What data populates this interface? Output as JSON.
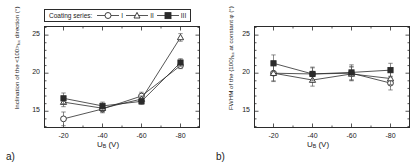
{
  "figure": {
    "panel_a_label": "a)",
    "panel_b_label": "b)"
  },
  "legend": {
    "title": "Coating series:",
    "entries": [
      {
        "label": "I",
        "marker": "open-circle"
      },
      {
        "label": "II",
        "marker": "open-triangle"
      },
      {
        "label": "III",
        "marker": "filled-square"
      }
    ]
  },
  "chart_data": [
    {
      "type": "line",
      "panel": "a",
      "title": "",
      "xlabel": "U_B (V)",
      "ylabel": "Inclination of the <100>fcc direction (°)",
      "x": [
        -20,
        -40,
        -60,
        -80
      ],
      "xticklabels": [
        "-20",
        "-40",
        "-60",
        "-80"
      ],
      "yticks": [
        15,
        20,
        25
      ],
      "yticklabels": [
        "15",
        "20",
        "25"
      ],
      "ylim": [
        12.8,
        26.2
      ],
      "grid": false,
      "legend_position": "above-axes",
      "series": [
        {
          "name": "I",
          "marker": "open-circle",
          "values": [
            14.0,
            15.3,
            17.0,
            21.0
          ],
          "errors": [
            0.9,
            0.5,
            0.5,
            0.4
          ]
        },
        {
          "name": "II",
          "marker": "open-triangle",
          "values": [
            16.2,
            15.4,
            16.6,
            24.7
          ],
          "errors": [
            0.6,
            0.5,
            0.4,
            0.5
          ]
        },
        {
          "name": "III",
          "marker": "filled-square",
          "values": [
            16.7,
            15.7,
            16.3,
            21.4
          ],
          "errors": [
            0.7,
            0.5,
            0.4,
            0.5
          ]
        }
      ]
    },
    {
      "type": "line",
      "panel": "b",
      "title": "",
      "xlabel": "U_B (V)",
      "ylabel": "FWHM of the {100}fcc at constant φ (°)",
      "x": [
        -20,
        -40,
        -60,
        -80
      ],
      "xticklabels": [
        "-20",
        "-40",
        "-60",
        "-80"
      ],
      "yticks": [
        15,
        20,
        25
      ],
      "yticklabels": [
        "15",
        "20",
        "25"
      ],
      "ylim": [
        12.8,
        26.2
      ],
      "grid": false,
      "legend_position": "none",
      "series": [
        {
          "name": "I",
          "marker": "open-circle",
          "values": [
            20.0,
            19.9,
            20.0,
            18.7
          ],
          "errors": [
            1.1,
            0.8,
            0.9,
            0.9
          ]
        },
        {
          "name": "II",
          "marker": "open-triangle",
          "values": [
            20.0,
            19.1,
            19.9,
            19.3
          ],
          "errors": [
            1.0,
            0.8,
            0.9,
            0.8
          ]
        },
        {
          "name": "III",
          "marker": "filled-square",
          "values": [
            21.3,
            19.9,
            20.1,
            20.4
          ],
          "errors": [
            1.1,
            0.9,
            1.0,
            0.9
          ]
        }
      ]
    }
  ],
  "axis_a": {
    "ylabel_pre": "Inclination of the <100>",
    "ylabel_sub": "fcc",
    "ylabel_post": " direction (°)",
    "xlabel_pre": "U",
    "xlabel_sub": "B",
    "xlabel_post": " (V)"
  },
  "axis_b": {
    "ylabel_pre": "FWHM of the {100}",
    "ylabel_sub": "fcc",
    "ylabel_post": " at constant φ (°)",
    "xlabel_pre": "U",
    "xlabel_sub": "B",
    "xlabel_post": " (V)"
  }
}
